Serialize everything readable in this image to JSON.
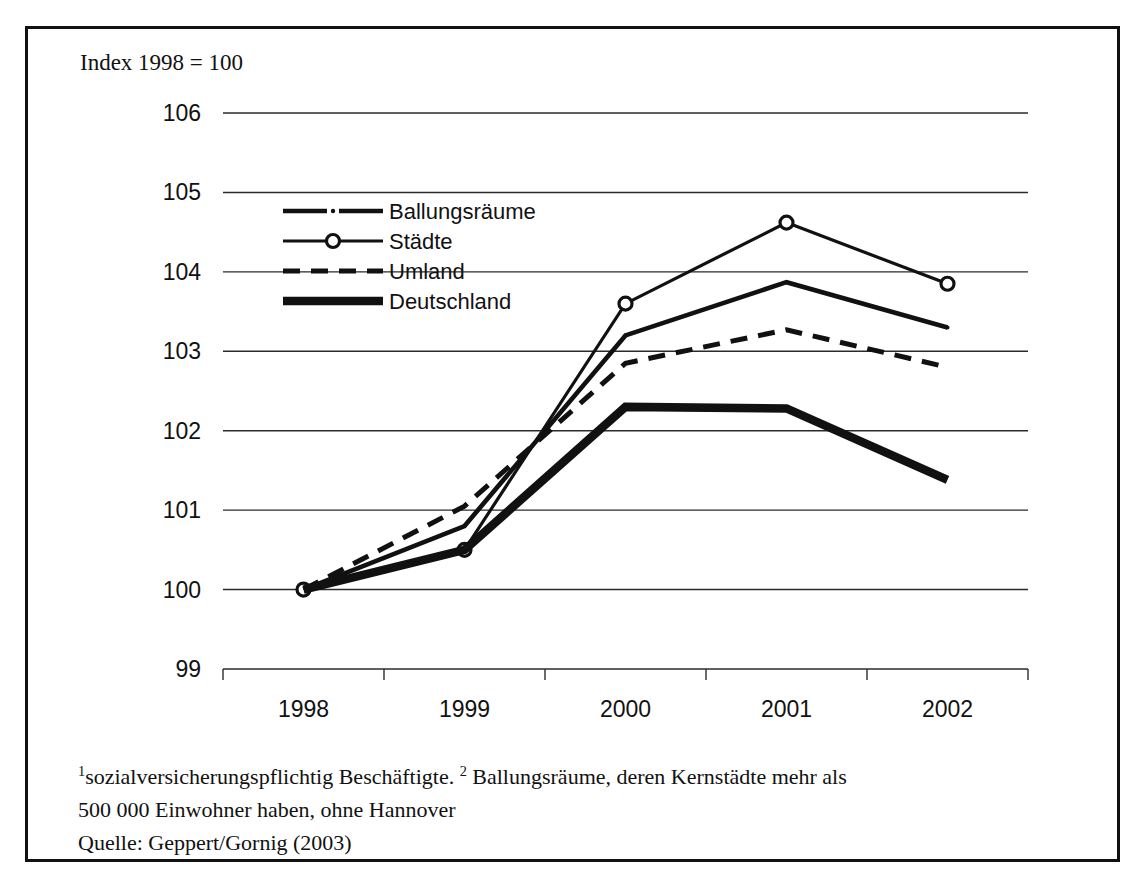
{
  "figure": {
    "title": "Index 1998 = 100",
    "footnotes": {
      "marker_1": "1",
      "line1_a": "sozialversicherungspflichtig Beschäftigte. ",
      "marker_2": "2",
      "line1_b": " Ballungsräume, deren Kernstädte mehr als",
      "line2": "500 000 Einwohner haben, ohne Hannover",
      "line3": "Quelle: Geppert/Gornig (2003)"
    }
  },
  "chart_data": {
    "type": "line",
    "title": "Index 1998 = 100",
    "xlabel": "",
    "ylabel": "",
    "categories": [
      "1998",
      "1999",
      "2000",
      "2001",
      "2002"
    ],
    "x": [
      1998,
      1999,
      2000,
      2001,
      2002
    ],
    "ylim": [
      99,
      106
    ],
    "yticks": [
      99,
      100,
      101,
      102,
      103,
      104,
      105,
      106
    ],
    "ytick_labels": [
      "99",
      "100",
      "101",
      "102",
      "103",
      "104",
      "105",
      "106"
    ],
    "grid": true,
    "grid_axis": "y",
    "legend_position": "upper left inside",
    "series": [
      {
        "name": "Ballungsräume",
        "style": "line-dash-dot-marker-dot",
        "color": "#111111",
        "values": [
          100.0,
          100.8,
          103.2,
          103.87,
          103.3
        ]
      },
      {
        "name": "Städte",
        "style": "line-open-circle-marker",
        "color": "#111111",
        "values": [
          100.0,
          100.5,
          103.6,
          104.62,
          103.85
        ]
      },
      {
        "name": "Umland",
        "style": "dashed",
        "color": "#111111",
        "values": [
          100.0,
          101.05,
          102.85,
          103.27,
          102.8
        ]
      },
      {
        "name": "Deutschland",
        "style": "thick-solid",
        "color": "#111111",
        "values": [
          100.0,
          100.5,
          102.3,
          102.28,
          101.38
        ]
      }
    ]
  },
  "legend": {
    "items": [
      {
        "label": "Ballungsräume"
      },
      {
        "label": "Städte"
      },
      {
        "label": "Umland"
      },
      {
        "label": "Deutschland"
      }
    ]
  }
}
